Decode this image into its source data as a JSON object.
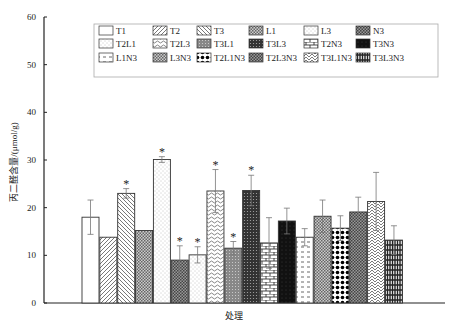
{
  "chart_data": {
    "type": "bar",
    "title": "",
    "xlabel": "处理",
    "ylabel": "丙二醛含量/(μmol/g)",
    "ylim": [
      0,
      60
    ],
    "yticks": [
      0,
      10,
      20,
      30,
      40,
      50,
      60
    ],
    "grid": false,
    "legend_position": "top",
    "categories": [
      "T1",
      "T2",
      "T3",
      "L1",
      "L3",
      "N3",
      "T2L1",
      "T2L3",
      "T3L1",
      "T3L3",
      "T2N3",
      "T3N3",
      "L1N3",
      "L3N3",
      "T2L1N3",
      "T2L3N3",
      "T3L1N3",
      "T3L3N3"
    ],
    "series": [
      {
        "name": "T1",
        "value": 18.0,
        "error": 3.6,
        "significant": false,
        "pattern": "blank"
      },
      {
        "name": "T2",
        "value": 13.8,
        "error": 0,
        "significant": false,
        "pattern": "diag-fwd"
      },
      {
        "name": "T3",
        "value": 23.0,
        "error": 1.0,
        "significant": true,
        "pattern": "diag-back"
      },
      {
        "name": "L1",
        "value": 15.2,
        "error": 0,
        "significant": false,
        "pattern": "check"
      },
      {
        "name": "L3",
        "value": 30.1,
        "error": 0.6,
        "significant": true,
        "pattern": "dots-light"
      },
      {
        "name": "N3",
        "value": 9.0,
        "error": 3.0,
        "significant": true,
        "pattern": "check-dark"
      },
      {
        "name": "T2L1",
        "value": 10.1,
        "error": 1.7,
        "significant": true,
        "pattern": "dots-light"
      },
      {
        "name": "T2L3",
        "value": 23.5,
        "error": 4.5,
        "significant": true,
        "pattern": "wave"
      },
      {
        "name": "T3L1",
        "value": 11.5,
        "error": 1.4,
        "significant": true,
        "pattern": "gray-dots"
      },
      {
        "name": "T3L3",
        "value": 23.6,
        "error": 3.2,
        "significant": true,
        "pattern": "dark-check"
      },
      {
        "name": "T2N3",
        "value": 12.6,
        "error": 5.3,
        "significant": false,
        "pattern": "brick"
      },
      {
        "name": "T3N3",
        "value": 17.2,
        "error": 2.7,
        "significant": false,
        "pattern": "black"
      },
      {
        "name": "L1N3",
        "value": 13.8,
        "error": 1.8,
        "significant": false,
        "pattern": "dash"
      },
      {
        "name": "L3N3",
        "value": 18.2,
        "error": 3.4,
        "significant": false,
        "pattern": "check"
      },
      {
        "name": "T2L1N3",
        "value": 15.7,
        "error": 2.6,
        "significant": false,
        "pattern": "black-dots"
      },
      {
        "name": "T2L3N3",
        "value": 19.1,
        "error": 3.1,
        "significant": false,
        "pattern": "check-dark"
      },
      {
        "name": "T3L1N3",
        "value": 21.3,
        "error": 6.1,
        "significant": false,
        "pattern": "scales"
      },
      {
        "name": "T3L3N3",
        "value": 13.2,
        "error": 3.0,
        "significant": false,
        "pattern": "grid-black"
      }
    ],
    "significance_marker": "*",
    "legend": [
      "T1",
      "T2",
      "T3",
      "L1",
      "L3",
      "N3",
      "T2L1",
      "T2L3",
      "T3L1",
      "T3L3",
      "T2N3",
      "T3N3",
      "L1N3",
      "L3N3",
      "T2L1N3",
      "T2L3N3",
      "T3L1N3",
      "T3L3N3"
    ]
  }
}
